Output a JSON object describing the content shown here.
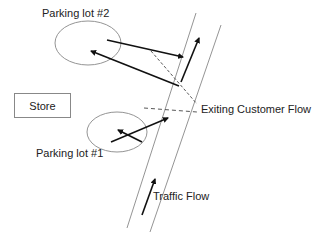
{
  "diagram": {
    "labels": {
      "parking_lot_2": "Parking lot #2",
      "parking_lot_1": "Parking lot #1",
      "store": "Store",
      "exiting_flow": "Exiting Customer Flow",
      "traffic_flow": "Traffic Flow"
    },
    "colors": {
      "outline": "#888888",
      "arrow": "#111111",
      "dashed": "#444444",
      "text": "#222222"
    }
  }
}
